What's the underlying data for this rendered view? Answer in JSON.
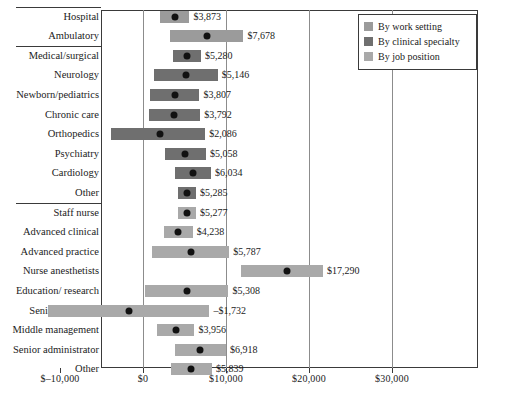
{
  "chart_data": {
    "type": "bar",
    "title": "",
    "subtitle": "",
    "xlabel": "",
    "ylabel": "",
    "xlim": [
      -12500,
      30500
    ],
    "grid": true,
    "legend_position": "top-right",
    "orientation": "horizontal",
    "xticks": [
      -10000,
      0,
      10000,
      20000,
      30000
    ],
    "xtick_labels": [
      "$–10,000",
      "$0",
      "$10,000",
      "$20,000",
      "$30,000"
    ],
    "legend": [
      {
        "label": "By work setting",
        "color": "#9b9b9b"
      },
      {
        "label": "By clinical specialty",
        "color": "#6f6f6f"
      },
      {
        "label": "By job position",
        "color": "#a9a9a9"
      }
    ],
    "groups": [
      {
        "name": "By work setting",
        "color": "#9b9b9b",
        "items": [
          {
            "category": "Hospital",
            "value": 3873,
            "label": "$3,873",
            "low": 2100,
            "high": 5600
          },
          {
            "category": "Ambulatory",
            "value": 7678,
            "label": "$7,678",
            "low": 3200,
            "high": 12100
          }
        ]
      },
      {
        "name": "By clinical specialty",
        "color": "#6f6f6f",
        "items": [
          {
            "category": "Medical/surgical",
            "value": 5280,
            "label": "$5,280",
            "low": 3600,
            "high": 7000
          },
          {
            "category": "Neurology",
            "value": 5146,
            "label": "$5,146",
            "low": 1300,
            "high": 9000
          },
          {
            "category": "Newborn/pediatrics",
            "value": 3807,
            "label": "$3,807",
            "low": 900,
            "high": 6800
          },
          {
            "category": "Chronic care",
            "value": 3792,
            "label": "$3,792",
            "low": 700,
            "high": 6900
          },
          {
            "category": "Orthopedics",
            "value": 2086,
            "label": "$2,086",
            "low": -3800,
            "high": 7500
          },
          {
            "category": "Psychiatry",
            "value": 5058,
            "label": "$5,058",
            "low": 2600,
            "high": 7600
          },
          {
            "category": "Cardiology",
            "value": 6034,
            "label": "$6,034",
            "low": 3900,
            "high": 8200
          },
          {
            "category": "Other",
            "value": 5285,
            "label": "$5,285",
            "low": 4200,
            "high": 6400
          }
        ]
      },
      {
        "name": "By job position",
        "color": "#a9a9a9",
        "items": [
          {
            "category": "Staff nurse",
            "value": 5277,
            "label": "$5,277",
            "low": 4200,
            "high": 6400
          },
          {
            "category": "Advanced clinical",
            "value": 4238,
            "label": "$4,238",
            "low": 2500,
            "high": 6000
          },
          {
            "category": "Advanced practice",
            "value": 5787,
            "label": "$5,787",
            "low": 1100,
            "high": 10400
          },
          {
            "category": "Nurse anesthetists",
            "value": 17290,
            "label": "$17,290",
            "low": 11800,
            "high": 21700
          },
          {
            "category": "Education/ research",
            "value": 5308,
            "label": "$5,308",
            "low": 300,
            "high": 10300
          },
          {
            "category": "Senior academic",
            "value": -1732,
            "label": "–$1,732",
            "low": -11500,
            "high": 8000
          },
          {
            "category": "Middle management",
            "value": 3956,
            "label": "$3,956",
            "low": 1700,
            "high": 6200
          },
          {
            "category": "Senior administrator",
            "value": 6918,
            "label": "$6,918",
            "low": 3800,
            "high": 10000
          },
          {
            "category": "Other",
            "value": 5839,
            "label": "$5,839",
            "low": 3400,
            "high": 8300
          }
        ]
      }
    ]
  }
}
